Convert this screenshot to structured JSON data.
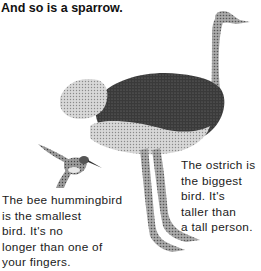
{
  "page": {
    "heading": "And so is a sparrow.",
    "captions": {
      "hummingbird": {
        "lines": [
          "The bee hummingbird",
          "is the smallest",
          "bird. It's no",
          "longer than one of",
          "your fingers."
        ]
      },
      "ostrich": {
        "lines": [
          "The ostrich is",
          "the biggest",
          "bird. It's",
          "taller than",
          "a tall person."
        ]
      }
    },
    "illustrations": [
      {
        "name": "ostrich",
        "style": "pen-and-ink stipple"
      },
      {
        "name": "bee-hummingbird",
        "style": "pen-and-ink stipple"
      }
    ]
  }
}
